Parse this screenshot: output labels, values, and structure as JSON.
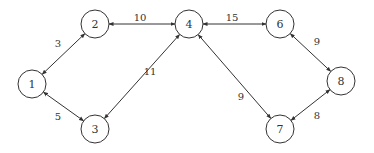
{
  "diagram": {
    "type": "weighted-graph",
    "directed": "bidirectional",
    "nodes": [
      {
        "id": "1",
        "label": "1",
        "x": 32,
        "y": 84
      },
      {
        "id": "2",
        "label": "2",
        "x": 95,
        "y": 24
      },
      {
        "id": "3",
        "label": "3",
        "x": 95,
        "y": 129
      },
      {
        "id": "4",
        "label": "4",
        "x": 189,
        "y": 24
      },
      {
        "id": "6",
        "label": "6",
        "x": 280,
        "y": 24
      },
      {
        "id": "7",
        "label": "7",
        "x": 280,
        "y": 129
      },
      {
        "id": "8",
        "label": "8",
        "x": 341,
        "y": 81
      }
    ],
    "edges": [
      {
        "from": "1",
        "to": "2",
        "weight": "3",
        "lx": 58,
        "ly": 43
      },
      {
        "from": "1",
        "to": "3",
        "weight": "5",
        "lx": 58,
        "ly": 116
      },
      {
        "from": "2",
        "to": "4",
        "weight": "10",
        "lx": 140,
        "ly": 17
      },
      {
        "from": "3",
        "to": "4",
        "weight": "11",
        "lx": 150,
        "ly": 71
      },
      {
        "from": "4",
        "to": "6",
        "weight": "15",
        "lx": 232,
        "ly": 17
      },
      {
        "from": "4",
        "to": "7",
        "weight": "9",
        "lx": 241,
        "ly": 96
      },
      {
        "from": "6",
        "to": "8",
        "weight": "9",
        "lx": 317,
        "ly": 41
      },
      {
        "from": "7",
        "to": "8",
        "weight": "8",
        "lx": 317,
        "ly": 115
      }
    ],
    "node_radius": 14,
    "colors": {
      "stroke": "#333333",
      "background": "#ffffff"
    }
  }
}
